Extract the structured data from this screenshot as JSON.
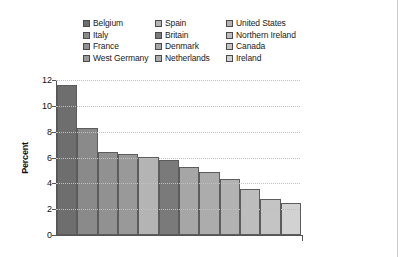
{
  "chart_data": {
    "type": "bar",
    "title": "",
    "xlabel": "",
    "ylabel": "Percent",
    "ylim": [
      0,
      12
    ],
    "yticks": [
      "0",
      "2",
      "4",
      "6",
      "8",
      "10",
      "12"
    ],
    "grid": true,
    "legend_position": "top",
    "categories": [
      "Belgium",
      "Italy",
      "France",
      "West Germany",
      "Spain",
      "Britain",
      "Denmark",
      "Netherlands",
      "United States",
      "Northern Ireland",
      "Canada",
      "Ireland"
    ],
    "values": [
      11.6,
      8.25,
      6.4,
      6.25,
      6.05,
      5.8,
      5.25,
      4.85,
      4.35,
      3.6,
      2.8,
      2.45
    ],
    "colors": [
      "#6e6e6e",
      "#8a8a8a",
      "#919191",
      "#999999",
      "#b4b4b4",
      "#7a7a7a",
      "#a6a6a6",
      "#acacac",
      "#b2b2b2",
      "#bdbdbd",
      "#c4c4c4",
      "#d2d2d2"
    ]
  },
  "legend": {
    "items": [
      {
        "label": "Belgium",
        "color": "#6e6e6e"
      },
      {
        "label": "Spain",
        "color": "#b4b4b4"
      },
      {
        "label": "United States",
        "color": "#b2b2b2"
      },
      {
        "label": "Italy",
        "color": "#8a8a8a"
      },
      {
        "label": "Britain",
        "color": "#7a7a7a"
      },
      {
        "label": "Northern Ireland",
        "color": "#bdbdbd"
      },
      {
        "label": "France",
        "color": "#919191"
      },
      {
        "label": "Denmark",
        "color": "#a6a6a6"
      },
      {
        "label": "Canada",
        "color": "#c4c4c4"
      },
      {
        "label": "West Germany",
        "color": "#999999"
      },
      {
        "label": "Netherlands",
        "color": "#acacac"
      },
      {
        "label": "Ireland",
        "color": "#d2d2d2"
      }
    ]
  }
}
